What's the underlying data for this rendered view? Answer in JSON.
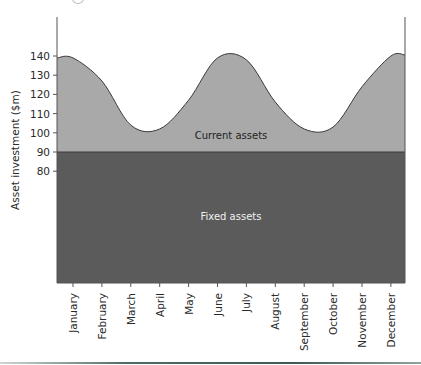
{
  "chart_data": {
    "type": "area",
    "title": "",
    "xlabel": "",
    "ylabel": "Asset investment ($m)",
    "ylim": [
      80,
      140
    ],
    "yticks": [
      80,
      90,
      100,
      110,
      120,
      130,
      140
    ],
    "categories": [
      "January",
      "February",
      "March",
      "April",
      "May",
      "June",
      "July",
      "August",
      "September",
      "October",
      "November",
      "December"
    ],
    "series": [
      {
        "name": "Fixed assets",
        "values": [
          90,
          90,
          90,
          90,
          90,
          90,
          90,
          90,
          90,
          90,
          90,
          90
        ],
        "color": "#5b5b5b"
      },
      {
        "name": "Current assets",
        "note": "total asset investment (top of light area)",
        "values": [
          139,
          127,
          104,
          102,
          117,
          139,
          138,
          116,
          102,
          103,
          124,
          140
        ],
        "color": "#a9a9a9"
      }
    ],
    "annotations": [
      "Current assets",
      "Fixed assets"
    ],
    "grid": false,
    "legend": "none (labels inside areas)"
  },
  "labels": {
    "y_axis_title": "Asset investment ($m)",
    "current_assets": "Current assets",
    "fixed_assets": "Fixed assets"
  }
}
